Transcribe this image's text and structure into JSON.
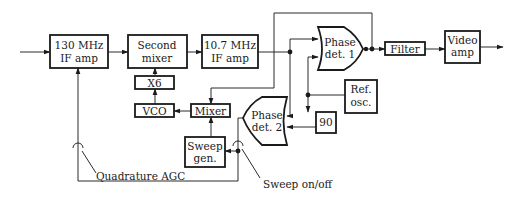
{
  "diagram": {
    "type": "block-diagram",
    "blocks": {
      "if_amp_130": {
        "line1": "130 MHz",
        "line2": "IF amp"
      },
      "second_mixer": {
        "line1": "Second",
        "line2": "mixer"
      },
      "if_amp_10_7": {
        "line1": "10.7 MHz",
        "line2": "IF amp"
      },
      "x6": {
        "label": "X6"
      },
      "vco": {
        "label": "VCO"
      },
      "mixer": {
        "label": "Mixer"
      },
      "sweep_gen": {
        "line1": "Sweep",
        "line2": "gen."
      },
      "phase_det_1": {
        "line1": "Phase",
        "line2": "det. 1"
      },
      "phase_det_2": {
        "line1": "Phase",
        "line2": "det. 2"
      },
      "filter": {
        "label": "Filter"
      },
      "video_amp": {
        "line1": "Video",
        "line2": "amp"
      },
      "ref_osc": {
        "line1": "Ref.",
        "line2": "osc."
      },
      "phase_shift_90": {
        "label": "90"
      }
    },
    "annotations": {
      "quadrature_agc": "Quadrature AGC",
      "sweep_on_off": "Sweep on/off"
    }
  }
}
